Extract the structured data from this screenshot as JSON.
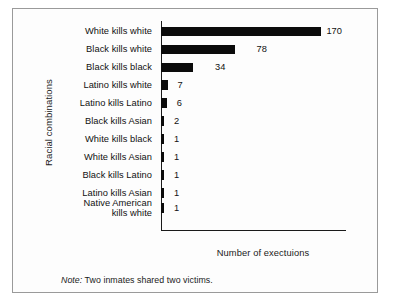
{
  "figure": {
    "y_axis_title": "Racial combinations",
    "x_axis_title": "Number of exectuions",
    "note_word": "Note:",
    "note_text": " Two inmates shared two victims."
  },
  "chart_data": {
    "type": "bar",
    "orientation": "horizontal",
    "title": "",
    "xlabel": "Number of exectuions",
    "ylabel": "Racial combinations",
    "categories": [
      "White kills white",
      "Black kills white",
      "Black kills black",
      "Latino kills white",
      "Latino kills Latino",
      "Black kills Asian",
      "White kills black",
      "White kills Asian",
      "Black kills Latino",
      "Latino kills Asian",
      "Native American kills white"
    ],
    "values": [
      170,
      78,
      34,
      7,
      6,
      2,
      1,
      1,
      1,
      1,
      1
    ],
    "value_labels": [
      "170",
      "78",
      "34",
      "7",
      "6",
      "2",
      "1",
      "1",
      "1",
      "1",
      "1"
    ],
    "xlim": [
      0,
      196
    ],
    "grid": false,
    "legend": false,
    "bar_color": "#0b0b0b",
    "annotations": [
      "Note: Two inmates shared two victims."
    ]
  }
}
